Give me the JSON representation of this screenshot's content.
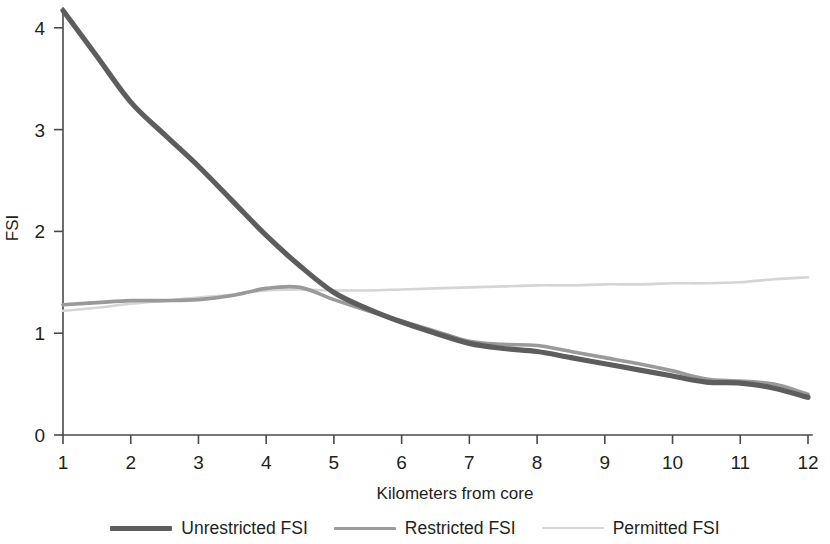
{
  "chart_data": {
    "type": "line",
    "title": "",
    "subtitle": "",
    "xlabel": "Kilometers from core",
    "ylabel": "FSI",
    "xlim": [
      1,
      12
    ],
    "ylim": [
      0,
      4.4
    ],
    "x_ticks": [
      "1",
      "2",
      "3",
      "4",
      "5",
      "6",
      "7",
      "8",
      "9",
      "10",
      "11",
      "12"
    ],
    "y_ticks": [
      "0",
      "1",
      "2",
      "3",
      "4"
    ],
    "grid": false,
    "legend_position": "bottom",
    "x": [
      1,
      1.5,
      2,
      2.5,
      3,
      3.5,
      4,
      4.5,
      5,
      5.5,
      6,
      6.5,
      7,
      7.5,
      8,
      8.5,
      9,
      9.5,
      10,
      10.5,
      11,
      11.5,
      12
    ],
    "series": [
      {
        "name": "Unrestricted FSI",
        "color": "#5d5d5d",
        "width": 5.2,
        "values": [
          4.17,
          3.72,
          3.27,
          2.95,
          2.64,
          2.3,
          1.96,
          1.66,
          1.4,
          1.24,
          1.11,
          1.0,
          0.9,
          0.85,
          0.82,
          0.76,
          0.7,
          0.64,
          0.58,
          0.52,
          0.51,
          0.46,
          0.37
        ]
      },
      {
        "name": "Restricted FSI",
        "color": "#9a9a9a",
        "width": 3.6,
        "values": [
          1.28,
          1.3,
          1.32,
          1.32,
          1.33,
          1.37,
          1.44,
          1.45,
          1.33,
          1.22,
          1.12,
          1.02,
          0.92,
          0.89,
          0.88,
          0.82,
          0.76,
          0.7,
          0.63,
          0.55,
          0.53,
          0.5,
          0.4
        ]
      },
      {
        "name": "Permitted FSI",
        "color": "#d5d5d5",
        "width": 2.6,
        "values": [
          1.22,
          1.25,
          1.29,
          1.32,
          1.35,
          1.38,
          1.42,
          1.43,
          1.42,
          1.42,
          1.43,
          1.44,
          1.45,
          1.46,
          1.47,
          1.47,
          1.48,
          1.48,
          1.49,
          1.49,
          1.5,
          1.53,
          1.55
        ]
      }
    ]
  },
  "legend": {
    "items": [
      {
        "label": "Unrestricted FSI",
        "color": "#5d5d5d",
        "weight": "thick"
      },
      {
        "label": "Restricted FSI",
        "color": "#9a9a9a",
        "weight": "thin"
      },
      {
        "label": "Permitted FSI",
        "color": "#d5d5d5",
        "weight": "hair"
      }
    ]
  }
}
